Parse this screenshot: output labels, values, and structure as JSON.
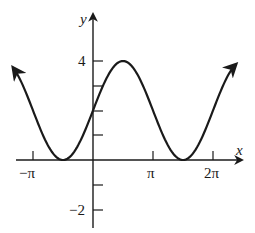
{
  "chart_data": {
    "type": "line",
    "title": "",
    "function": "y = 2 + 2 sin(x)",
    "xlabel": "x",
    "ylabel": "y",
    "x_ticks": [
      {
        "value": -3.14159,
        "label": "−π"
      },
      {
        "value": 3.14159,
        "label": "π"
      },
      {
        "value": 6.28319,
        "label": "2π"
      }
    ],
    "y_ticks": [
      {
        "value": -2,
        "label": "−2"
      },
      {
        "value": -1,
        "label": ""
      },
      {
        "value": 1,
        "label": ""
      },
      {
        "value": 2,
        "label": ""
      },
      {
        "value": 3,
        "label": ""
      },
      {
        "value": 4,
        "label": "4"
      }
    ],
    "xlim": [
      -4.2,
      7.6
    ],
    "ylim": [
      -3.0,
      5.3
    ],
    "grid": false,
    "legend": null,
    "series": [
      {
        "name": "curve",
        "x_range": [
          -4.19,
          7.49
        ],
        "points": [
          {
            "x": -4.19,
            "y": 3.73
          },
          {
            "x": -3.14159,
            "y": 2
          },
          {
            "x": -1.5708,
            "y": 0
          },
          {
            "x": 0,
            "y": 2
          },
          {
            "x": 1.5708,
            "y": 4
          },
          {
            "x": 3.14159,
            "y": 2
          },
          {
            "x": 4.7124,
            "y": 0
          },
          {
            "x": 6.28319,
            "y": 2
          },
          {
            "x": 7.49,
            "y": 3.86
          }
        ],
        "arrows_at_ends": true
      }
    ],
    "colors": {
      "curve": "#1a1a1a",
      "axes": "#1a1a1a"
    }
  },
  "labels": {
    "x_axis": "x",
    "y_axis": "y",
    "x_tick_neg_pi": "−π",
    "x_tick_pi": "π",
    "x_tick_2pi": "2π",
    "y_tick_4": "4",
    "y_tick_neg2": "−2"
  }
}
